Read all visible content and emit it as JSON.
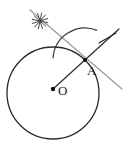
{
  "figure": {
    "kind": "geometry-construction",
    "canvas": {
      "width": 132,
      "height": 152,
      "background": "#ffffff"
    },
    "colors": {
      "stroke_dark": "#2b2b2b",
      "stroke_gray": "#9a9a9a",
      "point_fill": "#111111",
      "label": "#1c1c1c",
      "background": "#ffffff"
    },
    "labels": {
      "center_point": "O",
      "tangency_point": "A"
    },
    "points": [
      {
        "name": "O",
        "label": "O",
        "x": 53,
        "y": 89,
        "radius": 2.2,
        "label_dx": 5,
        "label_dy": 6
      },
      {
        "name": "A",
        "label": "A",
        "x": 85,
        "y": 60,
        "radius": 2.0,
        "label_dx": 2,
        "label_dy": 15
      }
    ],
    "circle_main": {
      "name": "main-circle",
      "cx": 53,
      "cy": 93,
      "r": 46,
      "stroke": "#2b2b2b",
      "stroke_width": 1.3
    },
    "arc_at_a": {
      "name": "construction-arc",
      "cx": 85,
      "cy": 60,
      "r": 32,
      "start_deg": 183,
      "end_deg": 292,
      "stroke": "#3a3a3a",
      "stroke_width": 1.2
    },
    "lines": [
      {
        "name": "secant-gray-line",
        "x1": 30,
        "y1": 10,
        "x2": 122,
        "y2": 89,
        "stroke": "#9a9a9a",
        "stroke_width": 1.2
      },
      {
        "name": "radius-dark-line",
        "x1": 53,
        "y1": 89,
        "x2": 119,
        "y2": 29,
        "stroke": "#2b2b2b",
        "stroke_width": 1.2
      }
    ],
    "tick_mark": {
      "name": "arc-tick-mark",
      "x1": 99,
      "y1": 43,
      "x2": 116,
      "y2": 33,
      "stroke": "#2b2b2b",
      "stroke_width": 1.2
    },
    "asterisk": {
      "name": "asterisk-mark",
      "cx": 40,
      "cy": 21,
      "r": 8,
      "ray_count": 6,
      "stroke": "#4a4a4a",
      "stroke_width": 1.0
    }
  }
}
